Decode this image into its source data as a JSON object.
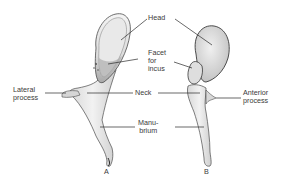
{
  "labels": {
    "head": "Head",
    "facet": "Facet\nfor\nincus",
    "lateral_process": "Lateral\nprocess",
    "neck": "Neck",
    "anterior_process": "Anterior\nprocess",
    "manubrium": "Manu-\nbrium",
    "view_a": "A",
    "view_b": "B"
  },
  "colors": {
    "background": "#ffffff",
    "text": "#3a3a3a",
    "leader_line": "#2a2a2a",
    "bone_fill": "#ececec",
    "bone_shade": "#bdbdbd",
    "bone_outline": "#4a4a4a"
  }
}
